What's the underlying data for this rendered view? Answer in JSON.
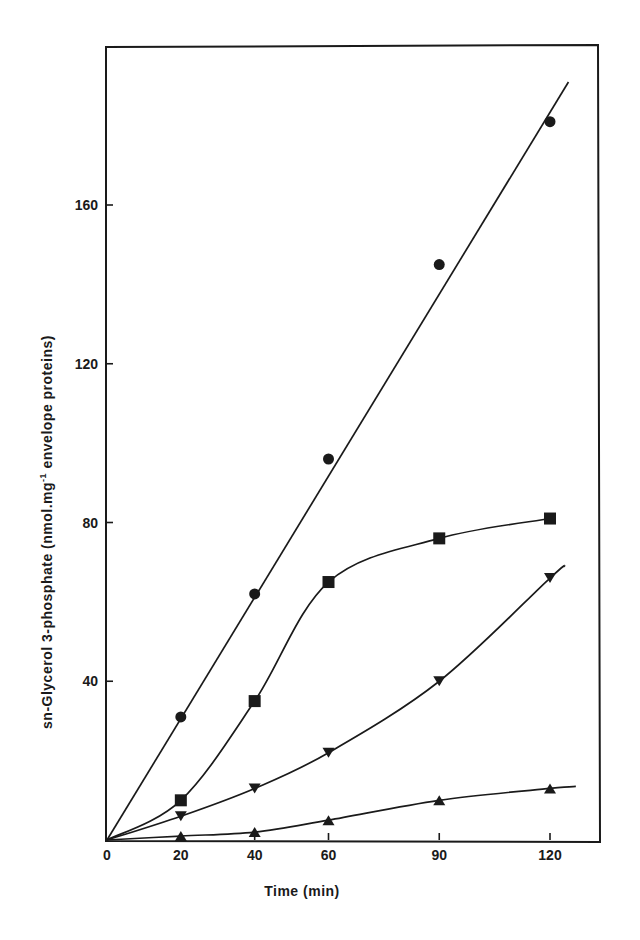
{
  "chart_data": {
    "type": "line",
    "title": "",
    "xlabel": "Time (min)",
    "ylabel": "sn-Glycerol 3-phosphate (nmol.mg⁻¹ envelope proteins)",
    "xlim": [
      0,
      127
    ],
    "ylim": [
      0,
      190
    ],
    "x_ticks": [
      0,
      20,
      40,
      60,
      90,
      120
    ],
    "y_ticks": [
      40,
      80,
      120,
      160
    ],
    "grid": false,
    "legend": null,
    "series": [
      {
        "name": "circles",
        "marker": "circle",
        "x": [
          0,
          20,
          40,
          60,
          90,
          120
        ],
        "values": [
          0,
          31,
          62,
          96,
          145,
          181
        ]
      },
      {
        "name": "squares",
        "marker": "square",
        "x": [
          0,
          20,
          40,
          60,
          90,
          120
        ],
        "values": [
          0,
          10,
          35,
          65,
          76,
          81
        ]
      },
      {
        "name": "down-triangles",
        "marker": "triangle-down",
        "x": [
          0,
          20,
          40,
          60,
          90,
          120
        ],
        "values": [
          0,
          6,
          13,
          22,
          40,
          66
        ]
      },
      {
        "name": "up-triangles",
        "marker": "triangle-up",
        "x": [
          0,
          20,
          40,
          60,
          90,
          120
        ],
        "values": [
          0,
          1,
          2,
          5,
          10,
          13
        ]
      }
    ]
  },
  "axes": {
    "x_title": "Time (min)",
    "y_title_main": "sn-Glycerol 3-phosphate  (nmol.mg",
    "y_title_sup": "-1",
    "y_title_tail": " envelope proteins)"
  }
}
